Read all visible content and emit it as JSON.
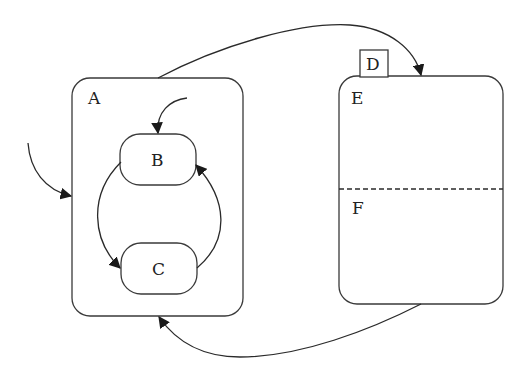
{
  "diagram": {
    "type": "statechart",
    "states": {
      "A": {
        "label": "A",
        "kind": "composite"
      },
      "B": {
        "label": "B",
        "kind": "simple",
        "parent": "A"
      },
      "C": {
        "label": "C",
        "kind": "simple",
        "parent": "A"
      },
      "D": {
        "label": "D",
        "kind": "tab-label"
      },
      "E": {
        "label": "E",
        "kind": "orthogonal-region"
      },
      "F": {
        "label": "F",
        "kind": "orthogonal-region"
      }
    },
    "transitions": [
      {
        "from": "external",
        "to": "A",
        "kind": "initial-entry"
      },
      {
        "from": "initial",
        "to": "B",
        "kind": "default"
      },
      {
        "from": "B",
        "to": "C"
      },
      {
        "from": "C",
        "to": "B"
      },
      {
        "from": "A",
        "to": "E"
      },
      {
        "from": "F",
        "to": "A"
      }
    ],
    "colors": {
      "stroke": "#3a3a3a",
      "background": "#ffffff"
    }
  }
}
